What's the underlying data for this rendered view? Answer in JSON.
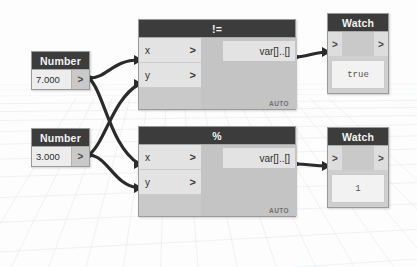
{
  "canvas": {
    "background_color": "#fdfdfd",
    "grid_color": "#e6e9ec",
    "wire_color": "#2b2b2b"
  },
  "theme": {
    "header_bg": "#3c3c3c",
    "header_text": "#f4f4f4",
    "node_body": "#c9c9c9",
    "port_row": "#e3e3e3"
  },
  "nodes": [
    {
      "id": "number-1",
      "type": "number-node",
      "title": "Number",
      "value": "7.000",
      "output_port_glyph": ">"
    },
    {
      "id": "number-2",
      "type": "number-node",
      "title": "Number",
      "value": "3.000",
      "output_port_glyph": ">"
    },
    {
      "id": "op-notequal",
      "type": "operator-node",
      "title": "!=",
      "inputs": [
        {
          "label": "x",
          "caret": ">"
        },
        {
          "label": "y",
          "caret": ">"
        }
      ],
      "output_label": "var[]..[]",
      "run_mode": "AUTO"
    },
    {
      "id": "op-modulo",
      "type": "operator-node",
      "title": "%",
      "inputs": [
        {
          "label": "x",
          "caret": ">"
        },
        {
          "label": "y",
          "caret": ">"
        }
      ],
      "output_label": "var[]..[]",
      "run_mode": "AUTO"
    },
    {
      "id": "watch-1",
      "type": "watch-node",
      "title": "Watch",
      "input_glyph": ">",
      "output_glyph": ">",
      "display_value": "true"
    },
    {
      "id": "watch-2",
      "type": "watch-node",
      "title": "Watch",
      "input_glyph": ">",
      "output_glyph": ">",
      "display_value": "1"
    }
  ],
  "connections": [
    {
      "from": "number-1",
      "to": "op-notequal.x"
    },
    {
      "from": "number-1",
      "to": "op-modulo.x"
    },
    {
      "from": "number-2",
      "to": "op-notequal.y"
    },
    {
      "from": "number-2",
      "to": "op-modulo.y"
    },
    {
      "from": "op-notequal.out",
      "to": "watch-1.in"
    },
    {
      "from": "op-modulo.out",
      "to": "watch-2.in"
    }
  ]
}
